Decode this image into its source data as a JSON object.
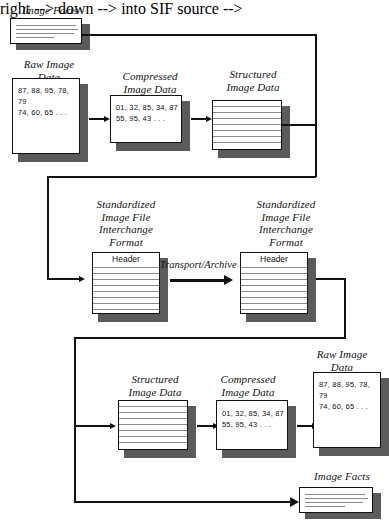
{
  "diagram": {
    "type": "flow-diagram",
    "rows": {
      "top": {
        "name": "encode-row",
        "nodes": [
          {
            "id": "image-facts-top",
            "label": "Image Facts",
            "kind": "facts-document",
            "lines": 4
          },
          {
            "id": "raw-image-data-top",
            "label": "Raw Image\nData",
            "kind": "data-document",
            "text": "87, 88, 95, 78, 79\n74, 60, 65 . . ."
          },
          {
            "id": "compressed-image-data-top",
            "label": "Compressed\nImage Data",
            "kind": "data-document",
            "text": "01, 32, 85, 34, 87\n55, 95, 43 . . ."
          },
          {
            "id": "structured-image-data-top",
            "label": "Structured\nImage Data",
            "kind": "ruled-document",
            "rules": 7
          }
        ]
      },
      "middle": {
        "name": "transport-row",
        "nodes": [
          {
            "id": "sif-source",
            "label": "Standardized\nImage File\nInterchange\nFormat",
            "kind": "sif-document",
            "header": "Header",
            "rules": 8
          },
          {
            "id": "sif-target",
            "label": "Standardized\nImage File\nInterchange\nFormat",
            "kind": "sif-document",
            "header": "Header",
            "rules": 8
          }
        ],
        "edge_label": "Transport/Archive"
      },
      "bottom": {
        "name": "decode-row",
        "nodes": [
          {
            "id": "structured-image-data-bottom",
            "label": "Structured\nImage Data",
            "kind": "ruled-document",
            "rules": 7
          },
          {
            "id": "compressed-image-data-bottom",
            "label": "Compressed\nImage Data",
            "kind": "data-document",
            "text": "01, 32, 85, 34, 87\n55, 95, 43 . . ."
          },
          {
            "id": "raw-image-data-bottom",
            "label": "Raw Image\nData",
            "kind": "data-document",
            "text": "87, 88, 95, 78, 79\n74, 60, 65 . . ."
          },
          {
            "id": "image-facts-bottom",
            "label": "Image Facts",
            "kind": "facts-document",
            "lines": 4
          }
        ]
      }
    },
    "colors": {
      "ink": "#111111",
      "paper": "#ffffff",
      "shadow": "#5b5b5b",
      "rule": "#8d8d8d"
    }
  }
}
